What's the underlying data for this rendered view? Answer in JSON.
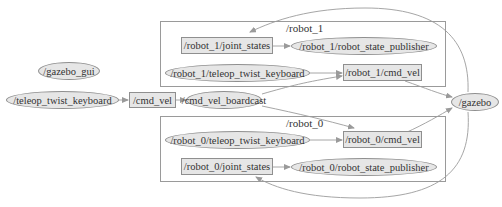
{
  "graph": {
    "type": "ros_rqt_graph",
    "colors": {
      "node_fill": "#e6e6e6",
      "node_stroke": "#8f8f8f",
      "edge": "#a0a0a0",
      "cluster_border": "#9a9a9a",
      "text": "#333333"
    },
    "clusters": [
      {
        "id": "robot_1",
        "label": "/robot_1"
      },
      {
        "id": "robot_0",
        "label": "/robot_0"
      }
    ],
    "nodes": {
      "gazebo_gui": "/gazebo_gui",
      "teleop_twist_keyboard": "/teleop_twist_keyboard",
      "cmd_vel_boardcast": "/cmd_vel_boardcast",
      "gazebo": "/gazebo",
      "robot_1_robot_state_publisher": "/robot_1/robot_state_publisher",
      "robot_1_teleop_twist_keyboard": "/robot_1/teleop_twist_keyboard",
      "robot_0_teleop_twist_keyboard": "/robot_0/teleop_twist_keyboard",
      "robot_0_robot_state_publisher": "/robot_0/robot_state_publisher"
    },
    "topics": {
      "cmd_vel": "/cmd_vel",
      "robot_1_joint_states": "/robot_1/joint_states",
      "robot_1_cmd_vel": "/robot_1/cmd_vel",
      "robot_0_cmd_vel": "/robot_0/cmd_vel",
      "robot_0_joint_states": "/robot_0/joint_states"
    },
    "edges": [
      {
        "from": "/teleop_twist_keyboard",
        "to": "/cmd_vel"
      },
      {
        "from": "/cmd_vel",
        "to": "/cmd_vel_boardcast"
      },
      {
        "from": "/cmd_vel_boardcast",
        "to": "/robot_1/cmd_vel"
      },
      {
        "from": "/cmd_vel_boardcast",
        "to": "/robot_0/cmd_vel"
      },
      {
        "from": "/robot_1/teleop_twist_keyboard",
        "to": "/robot_1/cmd_vel"
      },
      {
        "from": "/robot_0/teleop_twist_keyboard",
        "to": "/robot_0/cmd_vel"
      },
      {
        "from": "/robot_1/cmd_vel",
        "to": "/gazebo"
      },
      {
        "from": "/robot_0/cmd_vel",
        "to": "/gazebo"
      },
      {
        "from": "/gazebo",
        "to": "/robot_1/joint_states"
      },
      {
        "from": "/gazebo",
        "to": "/robot_0/joint_states"
      },
      {
        "from": "/robot_1/joint_states",
        "to": "/robot_1/robot_state_publisher"
      },
      {
        "from": "/robot_0/joint_states",
        "to": "/robot_0/robot_state_publisher"
      }
    ]
  }
}
